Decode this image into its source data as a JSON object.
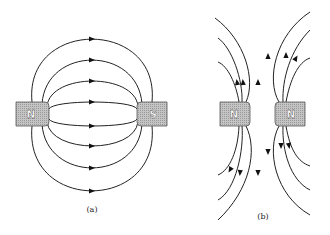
{
  "figure": {
    "panels": [
      {
        "id": "a",
        "caption": "(a)",
        "description": "Field lines between opposite poles (N to S)",
        "magnets": [
          {
            "label": "N",
            "pole": "north"
          },
          {
            "label": "S",
            "pole": "south"
          }
        ],
        "field_line_count": 8,
        "arrow_direction": "N-to-S"
      },
      {
        "id": "b",
        "caption": "(b)",
        "description": "Field lines between like poles (N and N) repelling",
        "magnets": [
          {
            "label": "N",
            "pole": "north"
          },
          {
            "label": "N",
            "pole": "north"
          }
        ],
        "field_line_count_per_magnet": 6,
        "arrow_direction": "away-from-poles"
      }
    ],
    "colors": {
      "line": "#222222",
      "magnet_fill": "#b5b5b5",
      "background": "#ffffff"
    }
  }
}
